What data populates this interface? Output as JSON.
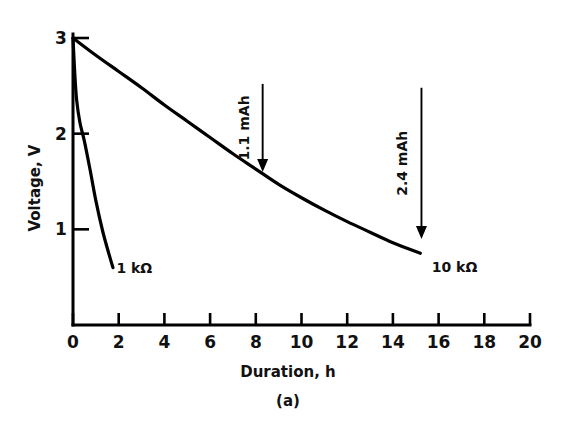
{
  "figure": {
    "caption": "(a)",
    "background_color": "#ffffff",
    "ink_color": "#000000"
  },
  "chart_data": {
    "type": "line",
    "title": "",
    "subtitle": "",
    "caption": "(a)",
    "xlabel": "Duration, h",
    "ylabel": "Voltage, V",
    "xlim": [
      0,
      20
    ],
    "ylim": [
      0,
      3
    ],
    "xticks": [
      0,
      2,
      4,
      6,
      8,
      10,
      12,
      14,
      16,
      18,
      20
    ],
    "xtick_labels": [
      "0",
      "2",
      "4",
      "6",
      "8",
      "10",
      "12",
      "14",
      "16",
      "18",
      "20"
    ],
    "yticks": [
      1,
      2,
      3
    ],
    "ytick_labels": [
      "1",
      "2",
      "3"
    ],
    "grid": false,
    "legend": "inline-labels",
    "series": [
      {
        "name": "1 kΩ",
        "label": "1 kΩ",
        "label_x": 1.9,
        "label_y": 0.54,
        "x": [
          0.0,
          0.08,
          0.16,
          0.3,
          0.5,
          0.75,
          1.0,
          1.3,
          1.6,
          1.75
        ],
        "y": [
          3.0,
          2.62,
          2.35,
          2.12,
          1.92,
          1.62,
          1.3,
          0.98,
          0.72,
          0.6
        ]
      },
      {
        "name": "10 kΩ",
        "label": "10 kΩ",
        "label_x": 15.7,
        "label_y": 0.55,
        "x": [
          0.0,
          1.0,
          2.0,
          3.0,
          4.0,
          5.0,
          6.0,
          7.0,
          8.0,
          9.0,
          10.0,
          11.0,
          12.0,
          13.0,
          14.0,
          15.2
        ],
        "y": [
          3.0,
          2.82,
          2.65,
          2.48,
          2.3,
          2.13,
          1.96,
          1.79,
          1.63,
          1.47,
          1.33,
          1.2,
          1.08,
          0.97,
          0.86,
          0.75
        ]
      }
    ],
    "annotations": [
      {
        "text": "1.1 mAh",
        "orientation": "vertical",
        "arrow_x": 8.3,
        "arrow_y_top": 2.52,
        "arrow_y_bottom": 1.6,
        "arrow_direction": "down"
      },
      {
        "text": "2.4 mAh",
        "orientation": "vertical",
        "arrow_x": 15.25,
        "arrow_y_top": 2.48,
        "arrow_y_bottom": 0.9,
        "arrow_direction": "down"
      }
    ]
  }
}
